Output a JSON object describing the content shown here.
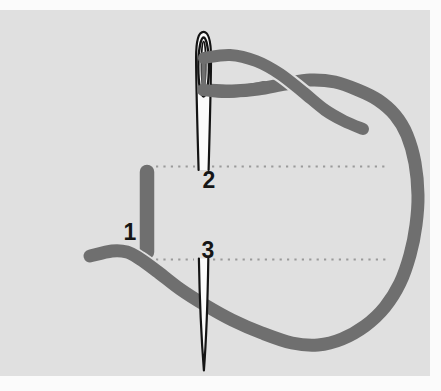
{
  "diagram": {
    "labels": {
      "point_1": "1",
      "point_2": "2",
      "point_3": "3"
    },
    "colors": {
      "background": "#fbfbfb",
      "panel": "#e0e0e0",
      "thread": "#6f6f6f",
      "needle_fill": "#fbfbfb",
      "needle_outline": "#141414",
      "guide_dots": "#9a9a9a",
      "label_text": "#161616"
    }
  }
}
